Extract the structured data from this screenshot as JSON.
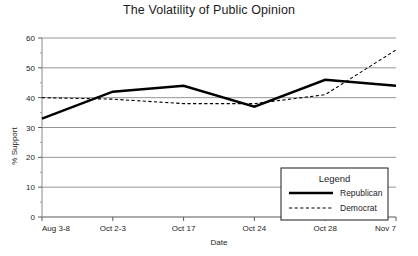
{
  "chart_data": {
    "type": "line",
    "title": "The Volatility of Public Opinion",
    "xlabel": "Date",
    "ylabel": "% Support",
    "categories": [
      "Aug 3-8",
      "Oct 2-3",
      "Oct 17",
      "Oct 24",
      "Oct 28",
      "Nov 7"
    ],
    "ylim": [
      0,
      60
    ],
    "yticks": [
      0,
      10,
      20,
      30,
      40,
      50,
      60
    ],
    "ytick_labels": [
      "0",
      "10",
      "20",
      "30",
      "40",
      "50",
      "60"
    ],
    "grid": true,
    "grid_axis": "y",
    "legend_position": "inside-bottom-right",
    "legend_title": "Legend",
    "series": [
      {
        "name": "Republican",
        "style": "solid",
        "color": "#000000",
        "width": 2.4,
        "values": [
          33,
          42,
          44,
          37,
          46,
          44
        ]
      },
      {
        "name": "Democrat",
        "style": "dashed",
        "color": "#000000",
        "width": 1.1,
        "values": [
          40,
          39.5,
          38,
          38,
          41,
          56
        ]
      }
    ]
  },
  "legend": {
    "title": "Legend",
    "entries": [
      {
        "label": "Republican",
        "style": "solid"
      },
      {
        "label": "Democrat",
        "style": "dashed"
      }
    ]
  }
}
